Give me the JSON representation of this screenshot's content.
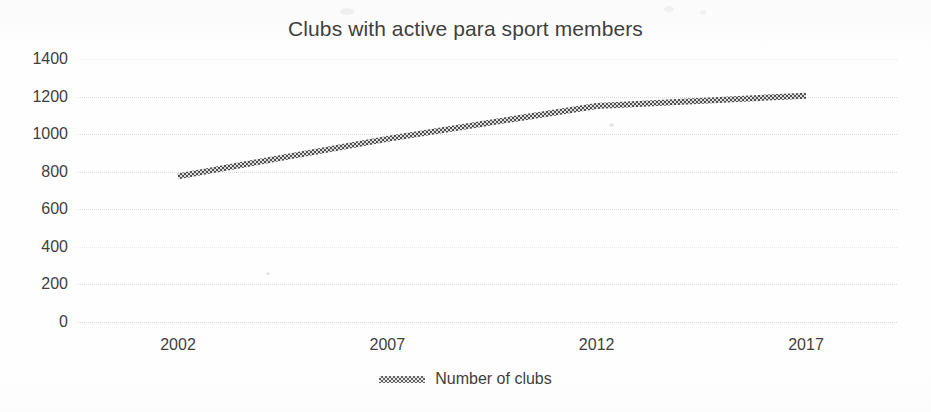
{
  "chart_data": {
    "type": "line",
    "title": "Clubs with active para sport members",
    "xlabel": "",
    "ylabel": "",
    "x": [
      2002,
      2007,
      2012,
      2017
    ],
    "xtick_labels": [
      "2002",
      "2007",
      "2012",
      "2017"
    ],
    "ytick_labels": [
      "1400",
      "1200",
      "1000",
      "800",
      "600",
      "400",
      "200",
      "0"
    ],
    "ylim": [
      0,
      1400
    ],
    "ytick_step": 200,
    "xlim": [
      2002,
      2017
    ],
    "grid": true,
    "legend_position": "bottom",
    "series": [
      {
        "name": "Number of clubs",
        "values": [
          775,
          975,
          1150,
          1205
        ],
        "color": "#5a5a5a",
        "style": "hatched-line"
      }
    ],
    "points": [
      {
        "year": 2002,
        "value": 775
      },
      {
        "year": 2007,
        "value": 975
      },
      {
        "year": 2012,
        "value": 1150
      },
      {
        "year": 2017,
        "value": 1205
      }
    ]
  },
  "legend": {
    "entries": [
      {
        "label": "Number of clubs",
        "marker": "hatched-line-marker"
      }
    ]
  }
}
